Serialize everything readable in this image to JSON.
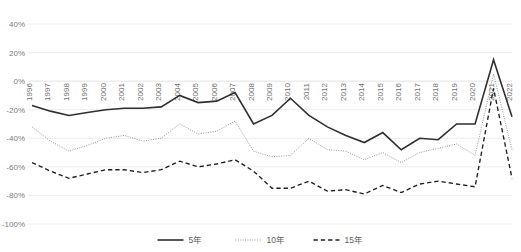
{
  "chart_data": {
    "type": "line",
    "title": "",
    "xlabel": "",
    "ylabel": "",
    "ylim": [
      -100,
      40
    ],
    "ytick_step": 20,
    "grid": true,
    "legend_position": "bottom",
    "ytick_labels": [
      "40%",
      "20%",
      "0%",
      "-20%",
      "-40%",
      "-60%",
      "-80%",
      "-100%"
    ],
    "ytick_values": [
      40,
      20,
      0,
      -20,
      -40,
      -60,
      -80,
      -100
    ],
    "categories": [
      "1996",
      "1997",
      "1998",
      "1999",
      "2000",
      "2001",
      "2002",
      "2003",
      "2004",
      "2005",
      "2006",
      "2007",
      "2008",
      "2009",
      "2010",
      "2011",
      "2012",
      "2013",
      "2014",
      "2015",
      "2016",
      "2017",
      "2018",
      "2019",
      "2020",
      "2021",
      "2022"
    ],
    "series": [
      {
        "name": "5年",
        "style": "solid",
        "color": "#2f2f2f",
        "values": [
          -17,
          -21,
          -24,
          -22,
          -20,
          -19,
          -19,
          -18,
          -10,
          -15,
          -14,
          -8,
          -30,
          -24,
          -12,
          -24,
          -32,
          -38,
          -43,
          -36,
          -48,
          -40,
          -41,
          -30,
          -30,
          15,
          -25
        ]
      },
      {
        "name": "10年",
        "style": "dotted",
        "color": "#8c8c8c",
        "values": [
          -32,
          -42,
          -49,
          -45,
          -40,
          -38,
          -42,
          -40,
          -30,
          -37,
          -35,
          -28,
          -49,
          -53,
          -52,
          -40,
          -48,
          -49,
          -55,
          -50,
          -57,
          -50,
          -47,
          -44,
          -52,
          5,
          -48
        ]
      },
      {
        "name": "15年",
        "style": "dashed",
        "color": "#1f1f1f",
        "values": [
          -57,
          -63,
          -68,
          -65,
          -62,
          -62,
          -64,
          -62,
          -56,
          -60,
          -58,
          -55,
          -63,
          -75,
          -75,
          -70,
          -77,
          -76,
          -79,
          -73,
          -78,
          -72,
          -70,
          -72,
          -74,
          -5,
          -68
        ]
      }
    ],
    "legend": [
      {
        "label": "5年",
        "style": "solid",
        "color": "#2f2f2f"
      },
      {
        "label": "10年",
        "style": "dotted",
        "color": "#8c8c8c"
      },
      {
        "label": "15年",
        "style": "dashed",
        "color": "#1f1f1f"
      }
    ]
  },
  "layout": {
    "plot_left": 32,
    "plot_right": 512,
    "plot_top": 24,
    "plot_bottom": 224,
    "legend_y": 240
  }
}
